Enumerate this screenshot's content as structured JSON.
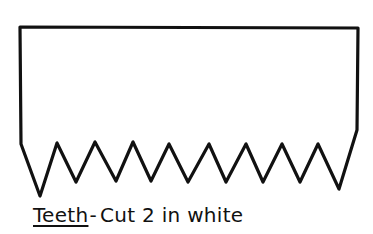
{
  "template": {
    "shape": "teeth-strip",
    "stroke_color": "#111111",
    "fill_color": "#ffffff",
    "outline_points": [
      [
        20,
        27
      ],
      [
        358,
        28
      ],
      [
        357,
        130
      ],
      [
        339,
        189
      ],
      [
        318,
        144
      ],
      [
        300,
        182
      ],
      [
        282,
        144
      ],
      [
        263,
        182
      ],
      [
        246,
        144
      ],
      [
        226,
        182
      ],
      [
        209,
        144
      ],
      [
        188,
        182
      ],
      [
        169,
        144
      ],
      [
        151,
        181
      ],
      [
        133,
        142
      ],
      [
        116,
        181
      ],
      [
        95,
        142
      ],
      [
        76,
        182
      ],
      [
        57,
        143
      ],
      [
        40,
        196
      ],
      [
        21,
        144
      ]
    ],
    "tooth_count": 9
  },
  "caption": {
    "title": "Teeth",
    "separator": "-",
    "instruction": "Cut 2 in white"
  }
}
